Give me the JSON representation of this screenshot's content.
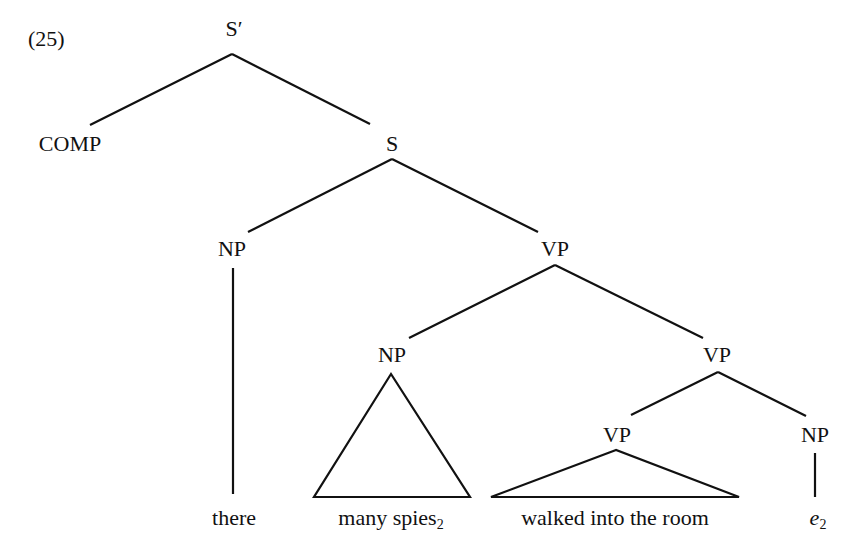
{
  "example_number": "(25)",
  "nodes": {
    "s_bar": "S′",
    "comp": "COMP",
    "s": "S",
    "np_subject": "NP",
    "vp_top": "VP",
    "np_object": "NP",
    "vp_mid": "VP",
    "vp_low": "VP",
    "np_trace": "NP"
  },
  "leaves": {
    "there": "there",
    "many_spies": "many spies",
    "many_spies_index": "2",
    "walked": "walked into the room",
    "trace": "e",
    "trace_index": "2"
  },
  "colors": {
    "ink": "#111111",
    "background": "#ffffff"
  }
}
